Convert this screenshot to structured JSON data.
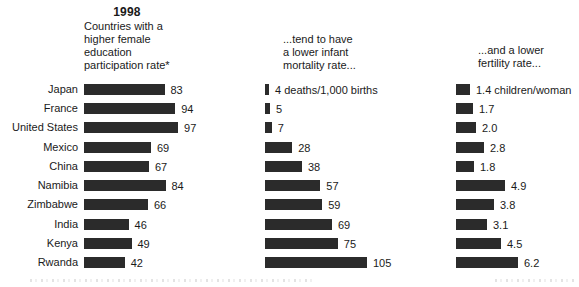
{
  "chart_data": {
    "type": "bar",
    "orientation": "horizontal",
    "title": "1998",
    "grid": false,
    "legend": "none",
    "categories": [
      "Japan",
      "France",
      "United States",
      "Mexico",
      "China",
      "Namibia",
      "Zimbabwe",
      "India",
      "Kenya",
      "Rwanda"
    ],
    "series": [
      {
        "header": "Countries with a\nhigher female\neducation\nparticipation rate*",
        "values": [
          83,
          94,
          97,
          69,
          67,
          84,
          66,
          46,
          49,
          42
        ],
        "value_labels": [
          "83",
          "94",
          "97",
          "69",
          "67",
          "84",
          "66",
          "46",
          "49",
          "42"
        ],
        "approx_range": [
          0,
          105
        ]
      },
      {
        "header": "...tend to have\na lower infant\nmortality rate...",
        "values": [
          4,
          5,
          7,
          28,
          38,
          57,
          59,
          69,
          75,
          105
        ],
        "value_labels": [
          "4 deaths/1,000 births",
          "5",
          "7",
          "28",
          "38",
          "57",
          "59",
          "69",
          "75",
          "105"
        ],
        "approx_range": [
          0,
          105
        ]
      },
      {
        "header": "...and a lower\nfertility rate...",
        "values": [
          1.4,
          1.7,
          2.0,
          2.8,
          1.8,
          4.9,
          3.8,
          3.1,
          4.5,
          6.2
        ],
        "value_labels": [
          "1.4 children/woman",
          "1.7",
          "2.0",
          "2.8",
          "1.8",
          "4.9",
          "3.8",
          "3.1",
          "4.5",
          "6.2"
        ],
        "approx_range": [
          0,
          6.5
        ]
      }
    ],
    "colors": {
      "bar": "#2b2b2b",
      "text": "#1a1a1a",
      "background": "#ffffff"
    }
  }
}
